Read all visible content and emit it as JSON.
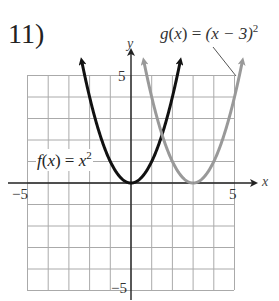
{
  "problem": {
    "number": "11)"
  },
  "labels": {
    "f": {
      "name": "f",
      "arg": "x",
      "rhs": "x",
      "exp": "2"
    },
    "g": {
      "name": "g",
      "arg": "x",
      "rhs": "(x − 3)",
      "exp": "2"
    }
  },
  "axes": {
    "x_name": "x",
    "y_name": "y",
    "x_min_label": "−5",
    "x_max_label": "5",
    "y_max_label": "5",
    "y_min_label": "−5"
  },
  "colors": {
    "f_curve": "#111111",
    "g_curve": "#999999",
    "grid": "#aaaaaa",
    "axes": "#222222"
  },
  "chart_data": {
    "type": "line",
    "title": "11)",
    "xlabel": "x",
    "ylabel": "y",
    "xlim": [
      -5,
      5
    ],
    "ylim": [
      -5,
      5
    ],
    "grid": true,
    "series": [
      {
        "name": "f(x) = x^2",
        "color": "#111111",
        "x": [
          -2.3,
          -2,
          -1.5,
          -1,
          -0.5,
          0,
          0.5,
          1,
          1.5,
          2,
          2.3
        ],
        "y": [
          5.3,
          4,
          2.25,
          1,
          0.25,
          0,
          0.25,
          1,
          2.25,
          4,
          5.3
        ]
      },
      {
        "name": "g(x) = (x − 3)^2",
        "color": "#999999",
        "x": [
          0.7,
          1,
          1.5,
          2,
          2.5,
          3,
          3.5,
          4,
          4.5,
          5,
          5.3
        ],
        "y": [
          5.3,
          4,
          2.25,
          1,
          0.25,
          0,
          0.25,
          1,
          2.25,
          4,
          5.3
        ]
      }
    ],
    "annotations": [
      "f(x) = x^2",
      "g(x) = (x − 3)^2"
    ]
  }
}
